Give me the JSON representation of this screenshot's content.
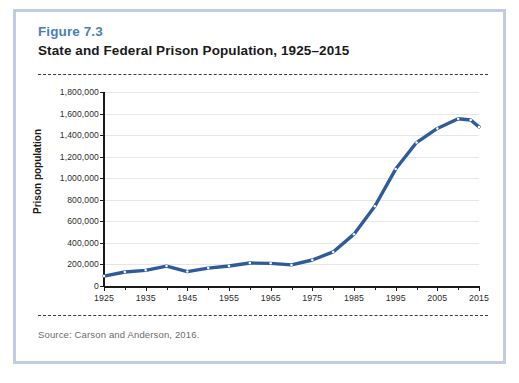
{
  "figure": {
    "label": "Figure 7.3",
    "title": "State and Federal Prison Population, 1925–2015",
    "source": "Source: Carson and Anderson, 2016."
  },
  "colors": {
    "label_blue": "#4a7fb5",
    "card_border": "#c3cbe4",
    "series_line": "#2f5b9c",
    "marker_fill": "#ffffff",
    "gridline": "#e6e6e6",
    "axis": "#1a1a1a"
  },
  "chart_data": {
    "type": "line",
    "title": "State and Federal Prison Population, 1925–2015",
    "xlabel": "",
    "ylabel": "Prison population",
    "xlim": [
      1925,
      2015
    ],
    "ylim": [
      0,
      1800000
    ],
    "grid": true,
    "legend": "none",
    "ytick_labels": [
      "1,800,000",
      "1,600,000",
      "1,400,000",
      "1,200,000",
      "1,000,000",
      "800,000",
      "600,000",
      "400,000",
      "200,000",
      "0"
    ],
    "ytick_values": [
      1800000,
      1600000,
      1400000,
      1200000,
      1000000,
      800000,
      600000,
      400000,
      200000,
      0
    ],
    "xtick_labels": [
      "1925",
      "1935",
      "1945",
      "1955",
      "1965",
      "1975",
      "1985",
      "1995",
      "2005",
      "2015"
    ],
    "xtick_values": [
      1925,
      1935,
      1945,
      1955,
      1965,
      1975,
      1985,
      1995,
      2005,
      2015
    ],
    "xminor_values": [
      1930,
      1940,
      1950,
      1960,
      1970,
      1980,
      1990,
      2000,
      2010
    ],
    "series": [
      {
        "name": "State and federal prison population",
        "x": [
          1925,
          1930,
          1935,
          1940,
          1945,
          1950,
          1955,
          1960,
          1965,
          1970,
          1975,
          1980,
          1985,
          1990,
          1995,
          2000,
          2005,
          2010,
          2013,
          2015
        ],
        "values": [
          92000,
          130000,
          145000,
          185000,
          134000,
          166000,
          186000,
          213000,
          210000,
          196000,
          241000,
          316000,
          481000,
          740000,
          1085000,
          1331000,
          1462000,
          1552000,
          1540000,
          1476000
        ]
      }
    ]
  }
}
